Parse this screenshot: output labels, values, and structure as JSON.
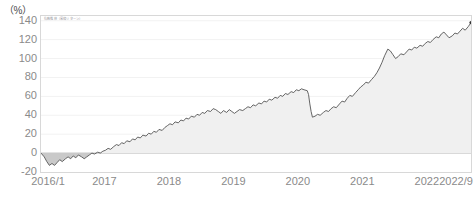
{
  "chart_data": {
    "type": "area",
    "title": "",
    "subtitle": "",
    "unit_label": "（%）",
    "legend_micro_text": "指数推移（累積リターン）",
    "xlabel": "",
    "ylabel": "",
    "ylim": [
      -20,
      145
    ],
    "yticks": [
      140,
      120,
      100,
      80,
      60,
      40,
      20,
      0,
      -20
    ],
    "ytick_labels": [
      "140",
      "120",
      "100",
      "80",
      "60",
      "40",
      "20",
      "0",
      "-20"
    ],
    "xlim": [
      "2016/1",
      "2022/9"
    ],
    "xticks": [
      0,
      1,
      2,
      3,
      4,
      5,
      6,
      6.67
    ],
    "xtick_labels": [
      "2016/1",
      "2017",
      "2018",
      "2019",
      "2020",
      "2021",
      "2022",
      "2022/9"
    ],
    "grid": "horizontal-faint",
    "legend_position": "none",
    "line_color": "#555555",
    "fill_color": "#f0f0f0",
    "negative_fill_color": "#c9c9c9",
    "axis_color": "#d8d8d8",
    "tick_text_color": "#8a8a8a",
    "end_marker": {
      "x": 6.67,
      "y": 138,
      "shape": "dot",
      "color": "#333333"
    },
    "series": [
      {
        "name": "累積リターン",
        "x": [
          0,
          0.05,
          0.09,
          0.13,
          0.17,
          0.21,
          0.25,
          0.29,
          0.33,
          0.38,
          0.42,
          0.46,
          0.5,
          0.54,
          0.58,
          0.63,
          0.67,
          0.71,
          0.75,
          0.79,
          0.83,
          0.88,
          0.92,
          0.96,
          1.0,
          1.04,
          1.08,
          1.13,
          1.17,
          1.21,
          1.25,
          1.29,
          1.33,
          1.38,
          1.42,
          1.46,
          1.5,
          1.54,
          1.58,
          1.63,
          1.67,
          1.71,
          1.75,
          1.79,
          1.83,
          1.88,
          1.92,
          1.96,
          2.0,
          2.04,
          2.08,
          2.13,
          2.17,
          2.21,
          2.25,
          2.29,
          2.33,
          2.38,
          2.42,
          2.46,
          2.5,
          2.54,
          2.58,
          2.63,
          2.67,
          2.71,
          2.75,
          2.79,
          2.83,
          2.88,
          2.92,
          2.96,
          3.0,
          3.04,
          3.08,
          3.13,
          3.17,
          3.21,
          3.25,
          3.29,
          3.33,
          3.38,
          3.42,
          3.46,
          3.5,
          3.54,
          3.58,
          3.63,
          3.67,
          3.71,
          3.75,
          3.79,
          3.83,
          3.88,
          3.92,
          3.96,
          4.0,
          4.04,
          4.08,
          4.13,
          4.15,
          4.17,
          4.19,
          4.21,
          4.25,
          4.29,
          4.33,
          4.38,
          4.42,
          4.46,
          4.5,
          4.54,
          4.58,
          4.63,
          4.67,
          4.71,
          4.75,
          4.79,
          4.83,
          4.88,
          4.92,
          4.96,
          5.0,
          5.04,
          5.08,
          5.13,
          5.17,
          5.21,
          5.25,
          5.29,
          5.33,
          5.38,
          5.42,
          5.46,
          5.5,
          5.54,
          5.58,
          5.63,
          5.67,
          5.71,
          5.75,
          5.79,
          5.83,
          5.88,
          5.92,
          5.96,
          6.0,
          6.04,
          6.08,
          6.13,
          6.17,
          6.21,
          6.25,
          6.29,
          6.33,
          6.38,
          6.42,
          6.46,
          6.5,
          6.54,
          6.58,
          6.63,
          6.67
        ],
        "values": [
          0,
          -4,
          -9,
          -13,
          -11,
          -13,
          -10,
          -7,
          -9,
          -6,
          -4,
          -6,
          -3,
          -5,
          -2,
          -4,
          -6,
          -4,
          -2,
          0,
          -1,
          1,
          0,
          2,
          3,
          5,
          4,
          7,
          9,
          8,
          11,
          10,
          13,
          12,
          15,
          14,
          17,
          16,
          19,
          18,
          21,
          20,
          23,
          22,
          25,
          24,
          27,
          29,
          31,
          30,
          33,
          32,
          35,
          34,
          37,
          36,
          39,
          38,
          41,
          40,
          43,
          42,
          45,
          44,
          47,
          46,
          44,
          42,
          45,
          43,
          46,
          44,
          42,
          44,
          46,
          45,
          47,
          49,
          48,
          51,
          50,
          53,
          52,
          55,
          54,
          57,
          56,
          59,
          58,
          61,
          60,
          63,
          62,
          65,
          64,
          67,
          66,
          68,
          67,
          66,
          62,
          52,
          44,
          38,
          39,
          41,
          40,
          43,
          45,
          44,
          47,
          49,
          48,
          52,
          55,
          54,
          58,
          61,
          60,
          64,
          67,
          70,
          72,
          75,
          74,
          78,
          81,
          85,
          90,
          96,
          103,
          110,
          108,
          104,
          100,
          102,
          105,
          104,
          107,
          110,
          109,
          112,
          111,
          114,
          113,
          116,
          118,
          117,
          120,
          123,
          122,
          126,
          128,
          125,
          122,
          124,
          127,
          126,
          129,
          132,
          130,
          134,
          138
        ]
      }
    ]
  }
}
